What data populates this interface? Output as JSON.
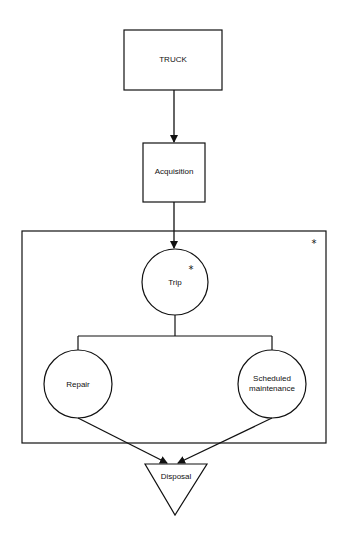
{
  "diagram": {
    "nodes": {
      "truck": {
        "label": "TRUCK",
        "shape": "rectangle"
      },
      "acquisition": {
        "label": "Acquisition",
        "shape": "rectangle"
      },
      "trip": {
        "label": "Trip",
        "shape": "circle",
        "marker": "*"
      },
      "repair": {
        "label": "Repair",
        "shape": "circle"
      },
      "scheduled_maintenance": {
        "label": "Scheduled maintenance",
        "label_line1": "Scheduled",
        "label_line2": "maintenance",
        "shape": "circle"
      },
      "disposal": {
        "label": "Disposal",
        "shape": "inverted-triangle"
      }
    },
    "group": {
      "label": "",
      "marker": "*",
      "contains": [
        "trip",
        "repair",
        "scheduled_maintenance"
      ]
    },
    "edges": [
      {
        "from": "truck",
        "to": "acquisition",
        "type": "arrow"
      },
      {
        "from": "acquisition",
        "to": "trip",
        "type": "arrow"
      },
      {
        "from": "trip",
        "to": "repair",
        "type": "line"
      },
      {
        "from": "trip",
        "to": "scheduled_maintenance",
        "type": "line"
      },
      {
        "from": "repair",
        "to": "disposal",
        "type": "arrow"
      },
      {
        "from": "scheduled_maintenance",
        "to": "disposal",
        "type": "arrow"
      }
    ],
    "colors": {
      "stroke": "#111111",
      "background": "#ffffff"
    }
  }
}
